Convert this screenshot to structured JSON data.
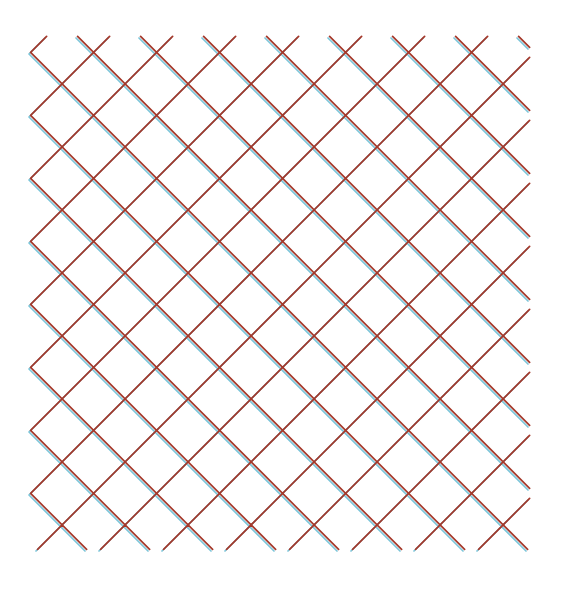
{
  "figure": {
    "title": "",
    "kind": "diagonal-lattice-grid",
    "background_color": "#ffffff",
    "width": 567,
    "height": 590
  },
  "chart_data": {
    "type": "line",
    "title": "",
    "subtitle": "",
    "xlabel": "",
    "ylabel": "",
    "grid": false,
    "legend": "none",
    "axis_visible": false,
    "tick_labels_x": [],
    "tick_labels_y": [],
    "xlim": [
      0,
      567
    ],
    "ylim": [
      0,
      590
    ],
    "series": [
      {
        "name": "under-layer",
        "color": "#7cc5d9",
        "line_width": 1.7,
        "offset_x": 0.0,
        "offset_y": 0.0,
        "z": 1
      },
      {
        "name": "over-layer",
        "color": "#a4382a",
        "line_width": 1.7,
        "offset_x": 1.6,
        "offset_y": -1.6,
        "z": 2
      }
    ],
    "lattice": {
      "spacing": 63.0,
      "angle_degrees": 45,
      "origin_x": 29.0,
      "origin_y": 38.0,
      "extent_x": 528.0,
      "extent_y": 551.0,
      "columns": 8,
      "rows": 8,
      "vertex_x_positions": [
        60,
        123,
        186,
        249,
        312,
        375,
        438,
        501
      ],
      "vertex_y_positions": [
        38,
        111,
        184,
        257,
        330,
        403,
        476,
        551
      ],
      "crossing_count_per_row": 8,
      "crossing_count_per_column": 8
    }
  },
  "colors": {
    "blue": "#7cc5d9",
    "red": "#a4382a",
    "background": "#ffffff"
  }
}
